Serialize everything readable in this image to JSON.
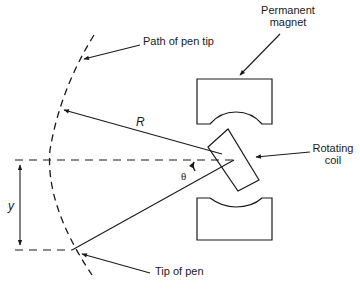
{
  "diagram": {
    "labels": {
      "path_of_pen_tip": "Path of pen tip",
      "permanent_magnet_line1": "Permanent",
      "permanent_magnet_line2": "magnet",
      "rotating_coil_line1": "Rotating",
      "rotating_coil_line2": "coil",
      "tip_of_pen": "Tip of pen",
      "radius": "R",
      "angle": "θ",
      "displacement": "y"
    },
    "colors": {
      "stroke": "#1a1a1a",
      "background": "#ffffff"
    }
  }
}
